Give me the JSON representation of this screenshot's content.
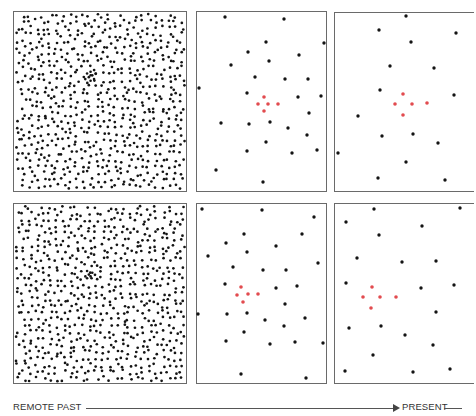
{
  "figure": {
    "colors": {
      "galaxy": "#141414",
      "highlight_cluster": "#e24b4f",
      "frame": "#6a6a6a"
    }
  },
  "timeline": {
    "start_label": "REMOTE PAST",
    "end_label": "PRESENT",
    "arrow_icon": "arrow-right"
  },
  "rows": [
    {
      "name": "top",
      "panels": [
        {
          "name": "dense",
          "epoch": "remote past",
          "seed": 7,
          "cluster": [
            [
              0.44,
              0.33
            ],
            [
              0.45,
              0.35
            ],
            [
              0.43,
              0.36
            ],
            [
              0.46,
              0.37
            ],
            [
              0.44,
              0.38
            ],
            [
              0.42,
              0.34
            ],
            [
              0.47,
              0.34
            ]
          ]
        },
        {
          "name": "intermediate",
          "epoch": "intermediate",
          "black": [
            [
              225,
              17
            ],
            [
              284,
              19
            ],
            [
              266,
              42
            ],
            [
              324,
              43
            ],
            [
              248,
              52
            ],
            [
              299,
              55
            ],
            [
              269,
              61
            ],
            [
              231,
              65
            ],
            [
              255,
              77
            ],
            [
              285,
              79
            ],
            [
              308,
              79
            ],
            [
              199,
              88
            ],
            [
              247,
              93
            ],
            [
              298,
              97
            ],
            [
              321,
              96
            ],
            [
              309,
              113
            ],
            [
              221,
              123
            ],
            [
              249,
              124
            ],
            [
              270,
              122
            ],
            [
              288,
              128
            ],
            [
              307,
              135
            ],
            [
              266,
              142
            ],
            [
              247,
              151
            ],
            [
              292,
              153
            ],
            [
              317,
              150
            ],
            [
              216,
              170
            ],
            [
              263,
              182
            ]
          ],
          "red": [
            [
              264,
              97
            ],
            [
              258,
              104
            ],
            [
              268,
              104
            ],
            [
              278,
              104
            ],
            [
              264,
              111
            ]
          ]
        },
        {
          "name": "sparse",
          "epoch": "present",
          "black": [
            [
              406,
              16
            ],
            [
              379,
              30
            ],
            [
              456,
              33
            ],
            [
              411,
              42
            ],
            [
              390,
              66
            ],
            [
              434,
              68
            ],
            [
              380,
              90
            ],
            [
              454,
              95
            ],
            [
              358,
              116
            ],
            [
              382,
              136
            ],
            [
              413,
              134
            ],
            [
              438,
              143
            ],
            [
              338,
              153
            ],
            [
              406,
              162
            ],
            [
              378,
              178
            ],
            [
              445,
              180
            ]
          ],
          "red": [
            [
              403,
              94
            ],
            [
              395,
              104
            ],
            [
              412,
              104
            ],
            [
              427,
              103
            ],
            [
              403,
              115
            ]
          ]
        }
      ]
    },
    {
      "name": "bottom",
      "panels": [
        {
          "name": "dense",
          "epoch": "remote past",
          "seed": 19,
          "cluster": [
            [
              0.42,
              0.37
            ],
            [
              0.43,
              0.39
            ],
            [
              0.41,
              0.4
            ],
            [
              0.44,
              0.4
            ],
            [
              0.42,
              0.41
            ],
            [
              0.45,
              0.38
            ]
          ]
        },
        {
          "name": "intermediate",
          "epoch": "intermediate",
          "black": [
            [
              202,
              209
            ],
            [
              262,
              210
            ],
            [
              314,
              217
            ],
            [
              244,
              234
            ],
            [
              302,
              234
            ],
            [
              226,
              243
            ],
            [
              276,
              246
            ],
            [
              247,
              252
            ],
            [
              208,
              256
            ],
            [
              318,
              263
            ],
            [
              233,
              267
            ],
            [
              263,
              270
            ],
            [
              286,
              270
            ],
            [
              225,
              284
            ],
            [
              276,
              288
            ],
            [
              297,
              286
            ],
            [
              285,
              304
            ],
            [
              198,
              314
            ],
            [
              227,
              314
            ],
            [
              247,
              313
            ],
            [
              305,
              318
            ],
            [
              265,
              320
            ],
            [
              284,
              326
            ],
            [
              244,
              332
            ],
            [
              226,
              341
            ],
            [
              270,
              344
            ],
            [
              295,
              342
            ],
            [
              323,
              343
            ],
            [
              241,
              374
            ],
            [
              306,
              378
            ]
          ],
          "red": [
            [
              241,
              287
            ],
            [
              237,
              295
            ],
            [
              248,
              294
            ],
            [
              258,
              294
            ],
            [
              243,
              302
            ]
          ]
        },
        {
          "name": "sparse",
          "epoch": "present",
          "black": [
            [
              374,
              209
            ],
            [
              460,
              208
            ],
            [
              346,
              222
            ],
            [
              422,
              226
            ],
            [
              379,
              235
            ],
            [
              357,
              258
            ],
            [
              402,
              262
            ],
            [
              436,
              261
            ],
            [
              346,
              283
            ],
            [
              421,
              288
            ],
            [
              454,
              285
            ],
            [
              436,
              312
            ],
            [
              349,
              328
            ],
            [
              381,
              326
            ],
            [
              405,
              335
            ],
            [
              433,
              345
            ],
            [
              373,
              355
            ],
            [
              345,
              371
            ],
            [
              413,
              372
            ],
            [
              450,
              369
            ]
          ],
          "red": [
            [
              372,
              287
            ],
            [
              363,
              297
            ],
            [
              380,
              297
            ],
            [
              396,
              297
            ],
            [
              371,
              308
            ]
          ]
        }
      ]
    }
  ]
}
